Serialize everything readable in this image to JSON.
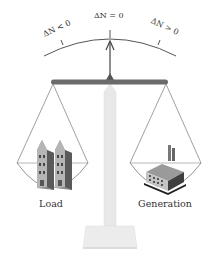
{
  "diagram": {
    "type": "balance-scale",
    "gauge": {
      "labels": {
        "left": "ΔN < 0",
        "center": "ΔN = 0",
        "right": "ΔN > 0"
      }
    },
    "pans": {
      "left": {
        "label": "Load",
        "icon": "houses-icon"
      },
      "right": {
        "label": "Generation",
        "icon": "factory-icon"
      }
    },
    "colors": {
      "beam": "#6b6b6b",
      "pillar": "#e6e6e6",
      "lines": "#555555",
      "text": "#333333"
    }
  }
}
